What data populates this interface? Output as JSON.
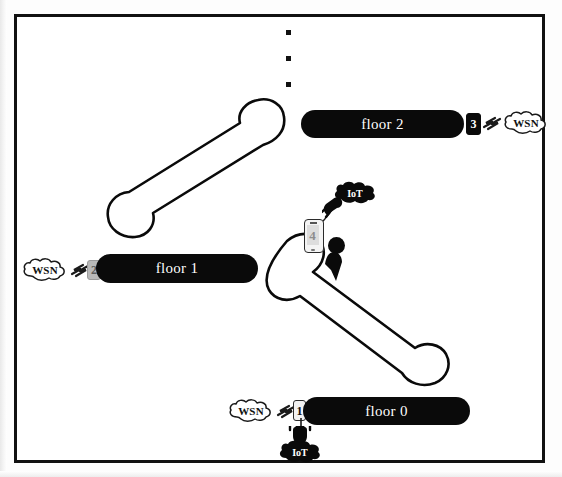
{
  "figure": {
    "type": "architecture-diagram",
    "border_color": "#111111",
    "bar_color": "#0a0a0a",
    "bar_text_color": "#ffffff"
  },
  "floors": [
    {
      "id": "floor-2",
      "label": "floor 2",
      "badge": "3",
      "badge_style": "dark",
      "badge_side": "right",
      "wsn_label": "WSN",
      "wsn_side": "right",
      "has_iot": false
    },
    {
      "id": "floor-1",
      "label": "floor 1",
      "badge": "2",
      "badge_style": "grey",
      "badge_side": "left",
      "wsn_label": "WSN",
      "wsn_side": "left",
      "has_iot": false
    },
    {
      "id": "floor-0",
      "label": "floor 0",
      "badge": "1",
      "badge_style": "light",
      "badge_side": "left",
      "wsn_label": "WSN",
      "wsn_side": "left",
      "has_iot": true,
      "iot_label": "IoT"
    }
  ],
  "mobile": {
    "badge": "4",
    "iot_label": "IoT",
    "person": "user-silhouette"
  },
  "continuation": {
    "symbol": "vertical-ellipsis",
    "dot_count": 3,
    "meaning": "more floors above"
  },
  "stairs": [
    {
      "id": "stairs-upper",
      "from": "floor 1",
      "to": "floor 2",
      "direction": "up-right"
    },
    {
      "id": "stairs-lower",
      "from": "floor 0",
      "to": "floor 1",
      "direction": "up-left"
    }
  ]
}
